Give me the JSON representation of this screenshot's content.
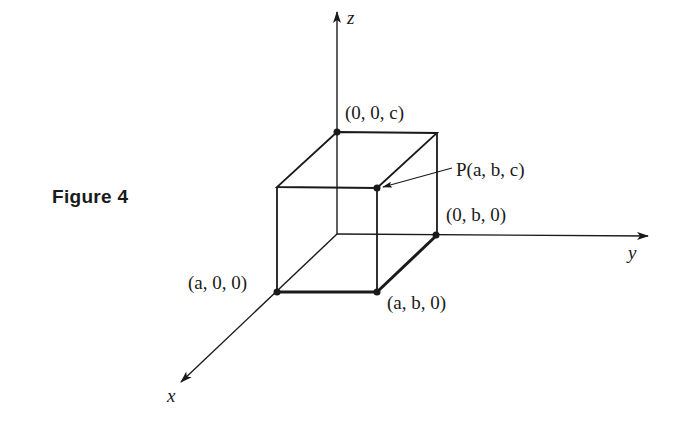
{
  "figure": {
    "caption": "Figure 4",
    "axes": {
      "x_label": "x",
      "y_label": "y",
      "z_label": "z"
    },
    "points": [
      {
        "id": "z-point",
        "label": "(0, 0, c)",
        "coords": [
          0,
          0,
          "c"
        ]
      },
      {
        "id": "p-point",
        "label": "P(a, b, c)",
        "coords": [
          "a",
          "b",
          "c"
        ]
      },
      {
        "id": "y-point",
        "label": "(0, b, 0)",
        "coords": [
          0,
          "b",
          0
        ]
      },
      {
        "id": "x-point",
        "label": "(a, 0, 0)",
        "coords": [
          "a",
          0,
          0
        ]
      },
      {
        "id": "xy-point",
        "label": "(a, b, 0)",
        "coords": [
          "a",
          "b",
          0
        ]
      }
    ],
    "colors": {
      "ink": "#1a1a1a",
      "background": "#ffffff"
    }
  }
}
